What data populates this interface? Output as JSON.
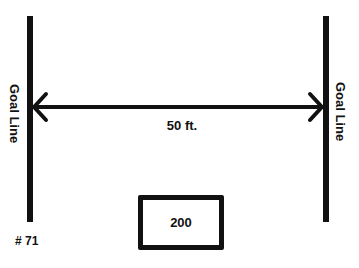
{
  "diagram": {
    "left_goal": {
      "label": "Goal Line"
    },
    "right_goal": {
      "label": "Goal Line"
    },
    "distance": {
      "label": "50 ft."
    },
    "box": {
      "value": "200"
    },
    "id_label": "# 71"
  },
  "colors": {
    "ink": "#111111",
    "background": "#ffffff"
  }
}
